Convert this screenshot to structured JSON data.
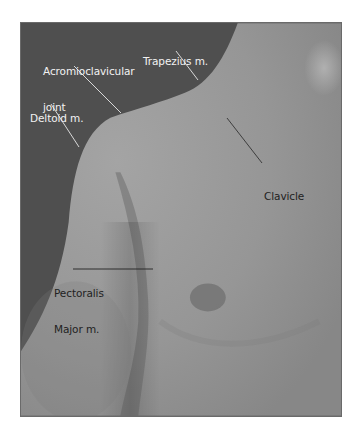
{
  "figure": {
    "colors": {
      "background_dark": "#4f4f4f",
      "skin_mid": "#8f8f8f",
      "skin_light": "#a3a3a3",
      "label_light": "#f2f2f2",
      "label_dark": "#222222",
      "page": "#ffffff"
    },
    "labels": [
      {
        "id": "acromioclavicular",
        "line1": "Acromioclavicular",
        "line2": "joint",
        "color": "light"
      },
      {
        "id": "trapezius",
        "line1": "Trapezius m.",
        "color": "light"
      },
      {
        "id": "deltoid",
        "line1": "Deltoid m.",
        "color": "light"
      },
      {
        "id": "clavicle",
        "line1": "Clavicle",
        "color": "dark"
      },
      {
        "id": "pectoralis",
        "line1": "Pectoralis",
        "line2": "Major m.",
        "color": "dark"
      }
    ]
  }
}
